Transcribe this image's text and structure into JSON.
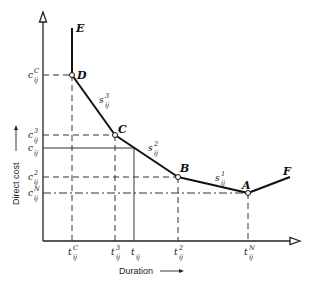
{
  "diagram": {
    "axes": {
      "ylabel": "Direct cost",
      "xlabel": "Duration"
    },
    "points": [
      {
        "id": "E",
        "label": "E"
      },
      {
        "id": "D",
        "label": "D"
      },
      {
        "id": "C",
        "label": "C"
      },
      {
        "id": "B",
        "label": "B"
      },
      {
        "id": "A",
        "label": "A"
      },
      {
        "id": "F",
        "label": "F"
      }
    ],
    "slopes": [
      {
        "base": "s",
        "sub": "ij",
        "sup": "3"
      },
      {
        "base": "s",
        "sub": "ij",
        "sup": "2"
      },
      {
        "base": "s",
        "sub": "ij",
        "sup": "1"
      }
    ],
    "y_ticks": [
      {
        "base": "c",
        "sub": "ij",
        "sup": "C"
      },
      {
        "base": "c",
        "sub": "ij",
        "sup": "3"
      },
      {
        "base": "c",
        "sub": "ij",
        "sup": ""
      },
      {
        "base": "c",
        "sub": "ij",
        "sup": "2"
      },
      {
        "base": "c",
        "sub": "ij",
        "sup": "N"
      }
    ],
    "x_ticks": [
      {
        "base": "t",
        "sub": "ij",
        "sup": "C"
      },
      {
        "base": "t",
        "sub": "ij",
        "sup": "3"
      },
      {
        "base": "t",
        "sub": "ij",
        "sup": ""
      },
      {
        "base": "t",
        "sub": "ij",
        "sup": "2"
      },
      {
        "base": "t",
        "sub": "ij",
        "sup": "N"
      }
    ]
  }
}
